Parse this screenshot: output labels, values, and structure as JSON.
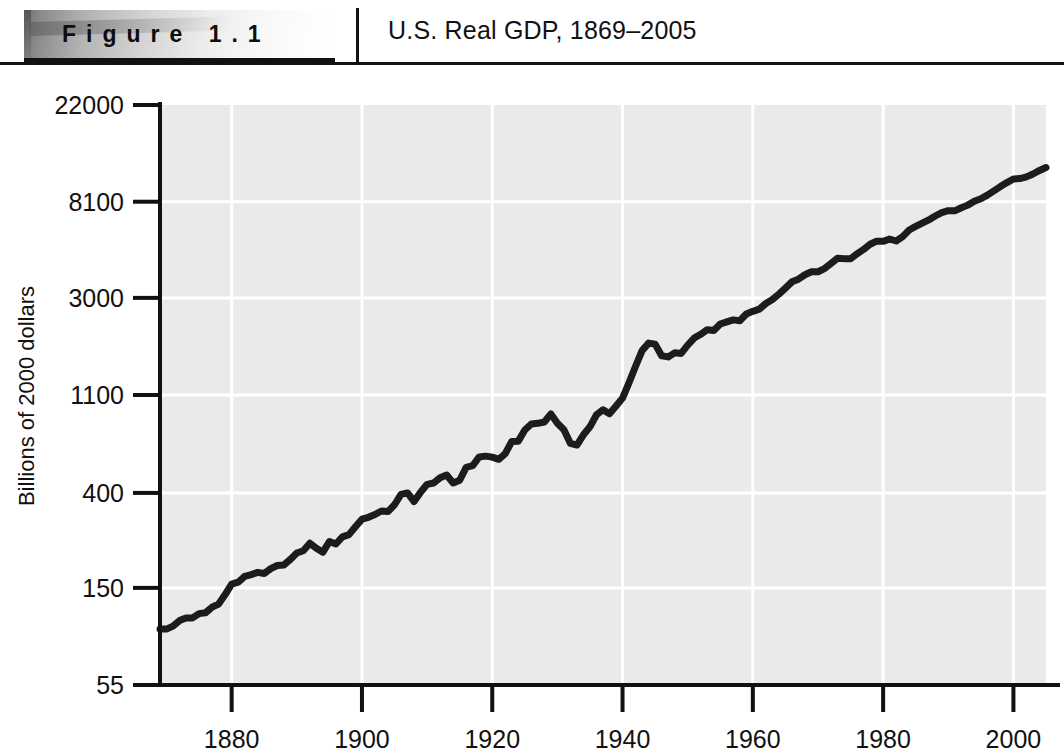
{
  "figure": {
    "label": "Figure 1.1",
    "title": "U.S. Real GDP, 1869–2005"
  },
  "chart_data": {
    "type": "line",
    "title": "U.S. Real GDP, 1869–2005",
    "xlabel": "",
    "ylabel": "Billions of 2000 dollars",
    "yscale": "log",
    "xlim": [
      1869,
      2005
    ],
    "ylim": [
      55,
      22000
    ],
    "ytick_values": [
      55,
      150,
      400,
      1100,
      3000,
      8100,
      22000
    ],
    "ytick_labels": [
      "55",
      "150",
      "400",
      "1100",
      "3000",
      "8100",
      "22000"
    ],
    "xtick_values": [
      1880,
      1900,
      1920,
      1940,
      1960,
      1980,
      2000
    ],
    "xtick_labels": [
      "1880",
      "1900",
      "1920",
      "1940",
      "1960",
      "1980",
      "2000"
    ],
    "grid": true,
    "grid_color": "#ffffff",
    "plot_bgcolor": "#eaeaea",
    "line_color": "#1c1c1c",
    "line_width": 7,
    "legend": null,
    "series": [
      {
        "name": "U.S. Real GDP",
        "x": [
          1869,
          1870,
          1871,
          1872,
          1873,
          1874,
          1875,
          1876,
          1877,
          1878,
          1879,
          1880,
          1881,
          1882,
          1883,
          1884,
          1885,
          1886,
          1887,
          1888,
          1889,
          1890,
          1891,
          1892,
          1893,
          1894,
          1895,
          1896,
          1897,
          1898,
          1899,
          1900,
          1901,
          1902,
          1903,
          1904,
          1905,
          1906,
          1907,
          1908,
          1909,
          1910,
          1911,
          1912,
          1913,
          1914,
          1915,
          1916,
          1917,
          1918,
          1919,
          1920,
          1921,
          1922,
          1923,
          1924,
          1925,
          1926,
          1927,
          1928,
          1929,
          1930,
          1931,
          1932,
          1933,
          1934,
          1935,
          1936,
          1937,
          1938,
          1939,
          1940,
          1941,
          1942,
          1943,
          1944,
          1945,
          1946,
          1947,
          1948,
          1949,
          1950,
          1951,
          1952,
          1953,
          1954,
          1955,
          1956,
          1957,
          1958,
          1959,
          1960,
          1961,
          1962,
          1963,
          1964,
          1965,
          1966,
          1967,
          1968,
          1969,
          1970,
          1971,
          1972,
          1973,
          1974,
          1975,
          1976,
          1977,
          1978,
          1979,
          1980,
          1981,
          1982,
          1983,
          1984,
          1985,
          1986,
          1987,
          1988,
          1989,
          1990,
          1991,
          1992,
          1993,
          1994,
          1995,
          1996,
          1997,
          1998,
          1999,
          2000,
          2001,
          2002,
          2003,
          2004,
          2005
        ],
        "y": [
          98,
          98,
          101,
          107,
          110,
          110,
          115,
          116,
          123,
          127,
          140,
          156,
          159,
          169,
          172,
          176,
          174,
          183,
          189,
          190,
          201,
          215,
          220,
          238,
          226,
          217,
          242,
          236,
          254,
          260,
          282,
          305,
          311,
          320,
          332,
          330,
          354,
          394,
          400,
          366,
          403,
          437,
          443,
          468,
          481,
          443,
          456,
          521,
          530,
          580,
          585,
          579,
          566,
          600,
          681,
          683,
          766,
          815,
          821,
          832,
          905,
          822,
          768,
          667,
          656,
          729,
          792,
          897,
          944,
          907,
          981,
          1065,
          1250,
          1480,
          1740,
          1880,
          1860,
          1650,
          1630,
          1700,
          1690,
          1840,
          1980,
          2060,
          2160,
          2140,
          2290,
          2340,
          2390,
          2370,
          2540,
          2610,
          2670,
          2830,
          2950,
          3120,
          3320,
          3540,
          3640,
          3810,
          3930,
          3930,
          4060,
          4280,
          4520,
          4500,
          4490,
          4730,
          4950,
          5220,
          5390,
          5380,
          5510,
          5400,
          5650,
          6050,
          6280,
          6490,
          6710,
          6990,
          7240,
          7380,
          7370,
          7610,
          7820,
          8140,
          8350,
          8670,
          9060,
          9470,
          9870,
          10250,
          10290,
          10470,
          10790,
          11190,
          11530
        ]
      }
    ]
  },
  "axes": {
    "y_title": "Billions of 2000 dollars"
  }
}
